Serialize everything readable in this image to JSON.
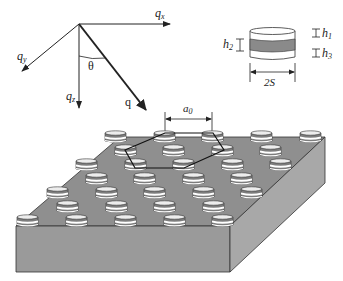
{
  "axes": {
    "qx": "q",
    "qx_sub": "x",
    "qy": "q",
    "qy_sub": "y",
    "qz": "q",
    "qz_sub": "z",
    "q": "q",
    "theta": "θ"
  },
  "inset": {
    "h1": "h",
    "h1_sub": "1",
    "h2": "h",
    "h2_sub": "2",
    "h3": "h",
    "h3_sub": "3",
    "width_label": "2S"
  },
  "lattice": {
    "spacing_label": "a",
    "spacing_sub": "0"
  },
  "colors": {
    "substrate_top": "#8f8f8f",
    "substrate_front": "#9a9a9a",
    "substrate_side": "#a8a8a8",
    "disc_dark": "#7d7d7d",
    "disc_light": "#ffffff",
    "line": "#222222"
  }
}
